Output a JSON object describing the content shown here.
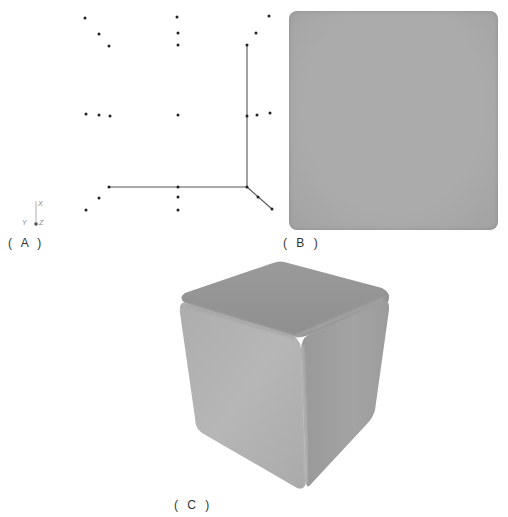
{
  "figure": {
    "panels": [
      {
        "id": "A",
        "label": "( A )",
        "description": "Point cloud / wireframe skeleton view"
      },
      {
        "id": "B",
        "label": "( B )",
        "description": "Flat-shaded front orthographic view"
      },
      {
        "id": "C",
        "label": "( C )",
        "description": "Rounded cube perspective render"
      }
    ],
    "axis_triad": {
      "x": "X",
      "y": "Y",
      "z": "Z"
    },
    "colors": {
      "points": "#222222",
      "lines": "#555555",
      "panel_b_fill": "#a9a9a9",
      "cube_top": "#959595",
      "cube_left": "#b2b2b2",
      "cube_right": "#a0a0a0"
    },
    "panel_a_points": [
      [
        85,
        18
      ],
      [
        99,
        34
      ],
      [
        109,
        46
      ],
      [
        177,
        17
      ],
      [
        178,
        33
      ],
      [
        178,
        45
      ],
      [
        269,
        16
      ],
      [
        256,
        33
      ],
      [
        247,
        45
      ],
      [
        86,
        114
      ],
      [
        99,
        115
      ],
      [
        110,
        116
      ],
      [
        178,
        115
      ],
      [
        247,
        116
      ],
      [
        257,
        115
      ],
      [
        270,
        113
      ],
      [
        109,
        187
      ],
      [
        178,
        187
      ],
      [
        247,
        187
      ],
      [
        99,
        198
      ],
      [
        178,
        197
      ],
      [
        258,
        197
      ],
      [
        86,
        210
      ],
      [
        178,
        210
      ],
      [
        272,
        209
      ]
    ],
    "panel_a_lines": [
      [
        [
          247,
          45
        ],
        [
          247,
          187
        ]
      ],
      [
        [
          109,
          187
        ],
        [
          247,
          187
        ]
      ],
      [
        [
          247,
          187
        ],
        [
          272,
          209
        ]
      ]
    ]
  }
}
